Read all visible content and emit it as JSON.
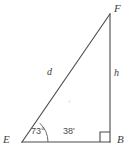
{
  "figure": {
    "type": "right-triangle-diagram",
    "canvas": {
      "width": 128,
      "height": 160,
      "background": "#ffffff"
    },
    "stroke_color": "#4a4a4a",
    "label_color": "#3e3e3e",
    "vertices": {
      "E": {
        "label": "E",
        "x": 22,
        "y": 142,
        "position": "bottom-left"
      },
      "B": {
        "label": "B",
        "x": 110,
        "y": 142,
        "position": "bottom-right"
      },
      "F": {
        "label": "F",
        "x": 110,
        "y": 14,
        "position": "top-right"
      }
    },
    "sides": {
      "hypotenuse": {
        "label": "d",
        "from": "E",
        "to": "F"
      },
      "vertical_leg": {
        "label": "h",
        "from": "B",
        "to": "F"
      },
      "base_leg": {
        "label": "",
        "from": "E",
        "to": "B"
      }
    },
    "angles": {
      "at_E": {
        "label": "73°",
        "vertex": "E",
        "marker": "arc"
      },
      "at_B": {
        "label": "",
        "vertex": "B",
        "marker": "right-angle-square"
      }
    },
    "base_annotation": {
      "label": "38'"
    }
  }
}
